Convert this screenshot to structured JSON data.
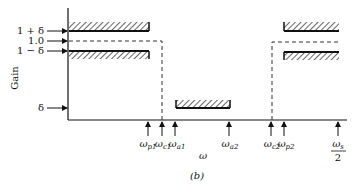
{
  "figure": {
    "caption": "(b)",
    "y_axis_label": "Gain",
    "x_axis_label": "ω",
    "y_ticks": [
      {
        "label": "1 + δ",
        "y": 31
      },
      {
        "label": "1.0",
        "y": 41
      },
      {
        "label": "1 − δ",
        "y": 51
      },
      {
        "label": "δ",
        "y": 108
      }
    ],
    "x_ticks": [
      {
        "id": "wp1",
        "base": "ω",
        "sub": "p1",
        "x": 148
      },
      {
        "id": "wc1",
        "base": "ω",
        "sub": "c1",
        "x": 162
      },
      {
        "id": "wa1",
        "base": "ω",
        "sub": "a1",
        "x": 175
      },
      {
        "id": "wa2",
        "base": "ω",
        "sub": "a2",
        "x": 229
      },
      {
        "id": "wc2",
        "base": "ω",
        "sub": "c2",
        "x": 271
      },
      {
        "id": "wp2",
        "base": "ω",
        "sub": "p2",
        "x": 284
      },
      {
        "id": "ws2",
        "base": "ω",
        "sub": "s",
        "frac_den": "2",
        "x": 338
      }
    ]
  }
}
